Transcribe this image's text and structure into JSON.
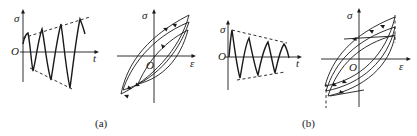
{
  "figure": {
    "panels": [
      {
        "id": "a",
        "caption": "(a)",
        "caption_pos": [
          95,
          118
        ],
        "time_plot": {
          "description": "Stress vs time, increasing amplitude",
          "y_label": "σ",
          "x_label": "t",
          "origin_label": "O",
          "axis_origin": [
            23,
            52
          ],
          "y_axis_top": 9,
          "y_axis_bottom": 82,
          "x_axis_right": 99,
          "y_label_pos": [
            14,
            13
          ],
          "x_label_pos": [
            93,
            53
          ],
          "origin_label_pos": [
            11,
            46
          ],
          "envelope_upper": [
            [
              23,
              38
            ],
            [
              90,
              17
            ]
          ],
          "envelope_lower": [
            [
              30,
              68
            ],
            [
              72,
              89
            ]
          ],
          "waveform": "M23,44 C24,38 26,34 28,33 C30,42 31,60 33,71 C36,60 38,40 42,29 C45,44 47,68 51,80 C54,62 57,38 61,24 C64,44 66,70 70,88 C73,66 76,38 80,19 C82,24 84,30 85,34"
        },
        "hysteresis_plot": {
          "description": "Stress-strain loops, cyclic hardening",
          "y_label": "σ",
          "x_label": "ε",
          "origin_label": "O",
          "axis_origin": [
            154,
            56
          ],
          "y_axis_top": 9,
          "y_axis_bottom": 103,
          "x_axis_left": 117,
          "x_axis_right": 196,
          "y_label_pos": [
            142,
            10
          ],
          "x_label_pos": [
            190,
            58
          ],
          "origin_label_pos": [
            146,
            60
          ],
          "loops": [
            "M121,94 C126,70 140,40 189,15 C180,50 150,80 121,94 Z",
            "M123,90 C130,68 150,38 189,22 C178,56 152,82 123,90 Z",
            "M138,84 C146,66 160,44 188,30 C180,60 162,78 138,84 Z"
          ],
          "arrows": [
            {
              "x": 172,
              "y": 24,
              "angle": 200
            },
            {
              "x": 163,
              "y": 28,
              "angle": 200
            },
            {
              "x": 161,
              "y": 44,
              "angle": 230
            },
            {
              "x": 140,
              "y": 86,
              "angle": 20
            },
            {
              "x": 132,
              "y": 89,
              "angle": 20
            },
            {
              "x": 124,
              "y": 95,
              "angle": 200
            }
          ]
        }
      },
      {
        "id": "b",
        "caption": "(b)",
        "caption_pos": [
          302,
          118
        ],
        "time_plot": {
          "description": "Stress vs time, decreasing amplitude",
          "y_label": "σ",
          "x_label": "t",
          "origin_label": "O",
          "axis_origin": [
            228,
            57
          ],
          "y_axis_top": 20,
          "y_axis_bottom": 90,
          "x_axis_right": 302,
          "y_label_pos": [
            220,
            24
          ],
          "x_label_pos": [
            296,
            58
          ],
          "origin_label_pos": [
            218,
            51
          ],
          "envelope_upper": [
            [
              232,
              30
            ],
            [
              287,
              43
            ]
          ],
          "envelope_lower": [
            [
              237,
              80
            ],
            [
              285,
              72
            ]
          ],
          "waveform": "M229,57 C230,45 231,35 232,30 C234,45 237,68 240,78 C243,62 245,45 249,38 C252,52 255,68 258,75 C261,60 264,48 268,42 C271,54 273,66 275,73 C278,60 280,50 284,44 C287,48 288,54 289,58"
        },
        "hysteresis_plot": {
          "description": "Stress-strain loops, cyclic softening",
          "y_label": "σ",
          "x_label": "ε",
          "origin_label": "O",
          "axis_origin": [
            359,
            59
          ],
          "y_axis_top": 8,
          "y_axis_bottom": 107,
          "x_axis_left": 321,
          "x_axis_right": 411,
          "y_label_pos": [
            347,
            10
          ],
          "x_label_pos": [
            399,
            61
          ],
          "origin_label_pos": [
            349,
            62
          ],
          "loops": [
            "M325,86 C332,60 350,35 395,17 C386,55 360,80 325,86 Z",
            "M326,91 C335,62 355,40 395,27 C388,60 362,84 326,91 Z",
            "M328,96 C338,65 360,44 395,35 C390,66 364,88 328,96 Z"
          ],
          "flat_segments": [
            [
              [
                344,
                39
              ],
              [
                394,
                36
              ]
            ],
            [
              [
                330,
                96
              ],
              [
                364,
                90
              ]
            ]
          ],
          "dashed_verticals": [
            [
              [
                395,
                15
              ],
              [
                395,
                43
              ]
            ],
            [
              [
                326,
                84
              ],
              [
                326,
                108
              ]
            ]
          ],
          "arrows": [
            {
              "x": 380,
              "y": 25,
              "angle": 205
            },
            {
              "x": 369,
              "y": 30,
              "angle": 205
            },
            {
              "x": 352,
              "y": 39,
              "angle": 180
            },
            {
              "x": 347,
              "y": 83,
              "angle": 20
            },
            {
              "x": 337,
              "y": 86,
              "angle": 20
            },
            {
              "x": 344,
              "y": 93,
              "angle": 15
            }
          ]
        }
      }
    ],
    "colors": {
      "ink": "#1a1a1a",
      "background": "#ffffff"
    }
  }
}
